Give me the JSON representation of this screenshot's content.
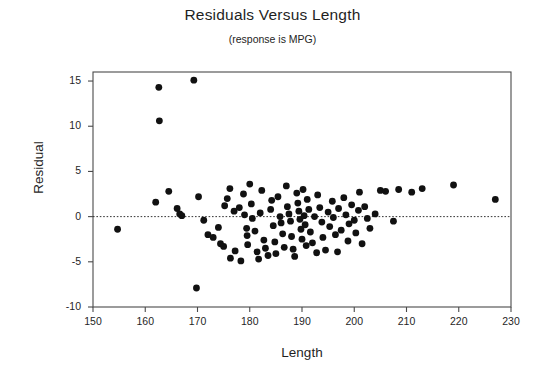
{
  "chart_data": {
    "type": "scatter",
    "title": "Residuals Versus Length",
    "subtitle": "(response is MPG)",
    "xlabel": "Length",
    "ylabel": "Residual",
    "xlim": [
      150,
      230
    ],
    "ylim": [
      -10,
      16
    ],
    "xticks": [
      150,
      160,
      170,
      180,
      190,
      200,
      210,
      220,
      230
    ],
    "yticks": [
      15,
      10,
      5,
      0,
      -5,
      -10
    ],
    "grid": false,
    "legend": null,
    "reference_line": {
      "y": 0,
      "style": "dotted"
    },
    "marker": {
      "shape": "circle",
      "color": "#111111",
      "size": 3.4
    },
    "points": [
      {
        "x": 154.7,
        "y": -1.4
      },
      {
        "x": 162.6,
        "y": 14.3
      },
      {
        "x": 162.7,
        "y": 10.6
      },
      {
        "x": 169.3,
        "y": 15.1
      },
      {
        "x": 162.0,
        "y": 1.6
      },
      {
        "x": 164.5,
        "y": 2.8
      },
      {
        "x": 166.1,
        "y": 0.9
      },
      {
        "x": 166.6,
        "y": 0.3
      },
      {
        "x": 167.0,
        "y": 0.1
      },
      {
        "x": 170.2,
        "y": 2.2
      },
      {
        "x": 169.8,
        "y": -7.9
      },
      {
        "x": 171.2,
        "y": -0.4
      },
      {
        "x": 172.0,
        "y": -2.0
      },
      {
        "x": 173.0,
        "y": -2.3
      },
      {
        "x": 174.0,
        "y": -1.2
      },
      {
        "x": 174.4,
        "y": -3.0
      },
      {
        "x": 175.0,
        "y": -3.3
      },
      {
        "x": 175.2,
        "y": 1.2
      },
      {
        "x": 175.7,
        "y": 2.0
      },
      {
        "x": 176.2,
        "y": 3.1
      },
      {
        "x": 176.3,
        "y": -4.6
      },
      {
        "x": 177.0,
        "y": 0.6
      },
      {
        "x": 177.2,
        "y": -3.8
      },
      {
        "x": 178.0,
        "y": 1.0
      },
      {
        "x": 178.3,
        "y": -4.9
      },
      {
        "x": 178.8,
        "y": 2.5
      },
      {
        "x": 179.0,
        "y": 0.2
      },
      {
        "x": 179.4,
        "y": -1.3
      },
      {
        "x": 179.5,
        "y": -2.1
      },
      {
        "x": 179.6,
        "y": -3.1
      },
      {
        "x": 180.0,
        "y": 3.6
      },
      {
        "x": 180.3,
        "y": 1.4
      },
      {
        "x": 180.5,
        "y": -0.2
      },
      {
        "x": 181.0,
        "y": -1.6
      },
      {
        "x": 181.4,
        "y": -3.9
      },
      {
        "x": 181.7,
        "y": -4.7
      },
      {
        "x": 182.0,
        "y": 0.4
      },
      {
        "x": 182.3,
        "y": 2.9
      },
      {
        "x": 182.7,
        "y": -2.6
      },
      {
        "x": 183.0,
        "y": -3.5
      },
      {
        "x": 183.5,
        "y": -4.3
      },
      {
        "x": 184.0,
        "y": 0.8
      },
      {
        "x": 184.2,
        "y": 1.8
      },
      {
        "x": 184.5,
        "y": -1.0
      },
      {
        "x": 184.8,
        "y": -2.8
      },
      {
        "x": 185.0,
        "y": -4.1
      },
      {
        "x": 185.4,
        "y": 2.2
      },
      {
        "x": 185.8,
        "y": 0.0
      },
      {
        "x": 186.0,
        "y": -0.7
      },
      {
        "x": 186.3,
        "y": -1.9
      },
      {
        "x": 186.6,
        "y": -3.4
      },
      {
        "x": 187.0,
        "y": 3.4
      },
      {
        "x": 187.2,
        "y": 1.1
      },
      {
        "x": 187.5,
        "y": 0.3
      },
      {
        "x": 187.8,
        "y": -0.5
      },
      {
        "x": 188.0,
        "y": -2.2
      },
      {
        "x": 188.3,
        "y": -3.6
      },
      {
        "x": 188.6,
        "y": -4.4
      },
      {
        "x": 189.0,
        "y": 2.6
      },
      {
        "x": 189.2,
        "y": 1.5
      },
      {
        "x": 189.4,
        "y": 0.6
      },
      {
        "x": 189.6,
        "y": -0.3
      },
      {
        "x": 189.8,
        "y": -1.4
      },
      {
        "x": 190.0,
        "y": -2.5
      },
      {
        "x": 190.2,
        "y": 3.0
      },
      {
        "x": 190.4,
        "y": 0.1
      },
      {
        "x": 190.6,
        "y": -0.9
      },
      {
        "x": 190.8,
        "y": -3.2
      },
      {
        "x": 191.0,
        "y": 1.9
      },
      {
        "x": 191.3,
        "y": 0.8
      },
      {
        "x": 191.6,
        "y": -1.7
      },
      {
        "x": 192.0,
        "y": -2.9
      },
      {
        "x": 192.4,
        "y": 0.0
      },
      {
        "x": 192.8,
        "y": -4.0
      },
      {
        "x": 193.0,
        "y": 2.4
      },
      {
        "x": 193.4,
        "y": 1.0
      },
      {
        "x": 193.8,
        "y": -0.6
      },
      {
        "x": 194.0,
        "y": -2.3
      },
      {
        "x": 194.5,
        "y": -3.7
      },
      {
        "x": 195.0,
        "y": 0.5
      },
      {
        "x": 195.3,
        "y": -1.1
      },
      {
        "x": 195.8,
        "y": 1.7
      },
      {
        "x": 196.0,
        "y": -0.1
      },
      {
        "x": 196.4,
        "y": -2.0
      },
      {
        "x": 196.8,
        "y": -3.9
      },
      {
        "x": 197.0,
        "y": 0.9
      },
      {
        "x": 197.5,
        "y": -1.5
      },
      {
        "x": 198.0,
        "y": 2.1
      },
      {
        "x": 198.4,
        "y": 0.2
      },
      {
        "x": 198.8,
        "y": -2.7
      },
      {
        "x": 199.0,
        "y": -0.8
      },
      {
        "x": 199.5,
        "y": 1.3
      },
      {
        "x": 200.0,
        "y": -0.4
      },
      {
        "x": 200.3,
        "y": -1.8
      },
      {
        "x": 200.8,
        "y": 0.7
      },
      {
        "x": 201.0,
        "y": 2.7
      },
      {
        "x": 201.5,
        "y": -3.0
      },
      {
        "x": 202.0,
        "y": 1.1
      },
      {
        "x": 202.5,
        "y": -0.2
      },
      {
        "x": 203.0,
        "y": -1.3
      },
      {
        "x": 204.0,
        "y": 0.3
      },
      {
        "x": 205.0,
        "y": 2.9
      },
      {
        "x": 206.0,
        "y": 2.8
      },
      {
        "x": 207.5,
        "y": -0.5
      },
      {
        "x": 208.5,
        "y": 3.0
      },
      {
        "x": 211.0,
        "y": 2.7
      },
      {
        "x": 213.0,
        "y": 3.1
      },
      {
        "x": 219.0,
        "y": 3.5
      },
      {
        "x": 227.0,
        "y": 1.9
      }
    ]
  }
}
